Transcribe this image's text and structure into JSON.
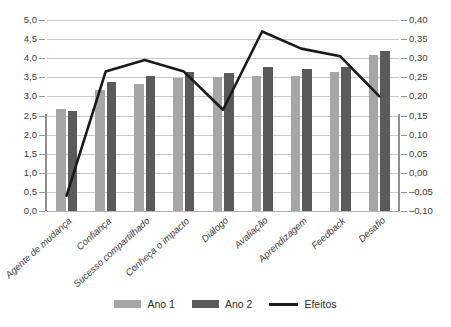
{
  "chart_data": {
    "type": "bar",
    "title": "",
    "xlabel": "",
    "ylabel": "",
    "grid": true,
    "legend_position": "bottom",
    "categories": [
      "Agente de mudança",
      "Confiança",
      "Sucesso compartilhado",
      "Conheça o impacto",
      "Diálogo",
      "Avaliação",
      "Aprendizagem",
      "Feedback",
      "Desafio"
    ],
    "series": [
      {
        "name": "Ano 1",
        "type": "bar",
        "axis": "left",
        "color": "#a6a6a6",
        "values": [
          2.67,
          3.17,
          3.33,
          3.49,
          3.52,
          3.54,
          3.54,
          3.63,
          4.08
        ]
      },
      {
        "name": "Ano 2",
        "type": "bar",
        "axis": "left",
        "color": "#5a5a5a",
        "values": [
          2.63,
          3.37,
          3.54,
          3.64,
          3.61,
          3.78,
          3.71,
          3.78,
          4.18
        ]
      },
      {
        "name": "Efeitos",
        "type": "line",
        "axis": "right",
        "color": "#1a1a1a",
        "values": [
          -0.06,
          0.265,
          0.295,
          0.265,
          0.165,
          0.37,
          0.325,
          0.305,
          0.2
        ]
      }
    ],
    "left_axis": {
      "min": 0.0,
      "max": 5.0,
      "step": 0.5,
      "ticks": [
        "0,0",
        "0,5",
        "1,0",
        "1,5",
        "2,0",
        "2,5",
        "3,0",
        "3,5",
        "4,0",
        "4,5",
        "5,0"
      ]
    },
    "right_axis": {
      "min": -0.1,
      "max": 0.4,
      "step": 0.05,
      "ticks": [
        "-0,10",
        "-0,05",
        "0,00",
        "0,05",
        "0,10",
        "0,15",
        "0,20",
        "0,25",
        "0,30",
        "0,35",
        "0,40"
      ]
    }
  },
  "legend": {
    "items": [
      {
        "label": "Ano 1",
        "marker": "swatch-light-gray"
      },
      {
        "label": "Ano 2",
        "marker": "swatch-dark-gray"
      },
      {
        "label": "Efeitos",
        "marker": "line-black"
      }
    ]
  },
  "caption": {
    "text": ""
  }
}
